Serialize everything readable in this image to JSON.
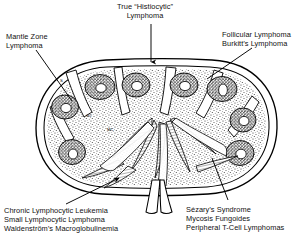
{
  "figure": {
    "kind": "lymph-node-cross-section-diagram",
    "background_color": "#ffffff",
    "ink_color": "#000000"
  },
  "labels": {
    "true_histiocytic": {
      "line1": "True “Histiocytic”",
      "line2": "Lymphoma"
    },
    "mantle_zone": {
      "line1": "Mantle Zone",
      "line2": "Lymphoma"
    },
    "follicular": {
      "line1": "Follicular Lymphoma",
      "line2": "Burkitt’s Lymphoma"
    },
    "chronic_group": {
      "line1": "Chronic Lymphocytic Leukemia",
      "line2": "Small Lymphocytic Lymphoma",
      "line3": "Waldenström’s Macroglobulinemia"
    },
    "sezary_group": {
      "line1": "Sézary’s Syndrome",
      "line2": "Mycosis Fungoides",
      "line3": "Peripheral T-Cell Lymphomas"
    }
  },
  "structure_labels": {
    "subcapsular_sinus": "S",
    "medullary_cords": "MC",
    "germinal_center": "GC"
  },
  "anatomy": {
    "capsule": "outer oval capsule of lymph node",
    "cortex": "stippled cortical region",
    "follicles_count": 9,
    "germinal_centers": "pale centers within dark follicles",
    "medulla": "radiating medullary cords and sinuses",
    "hilum": "vessels entering at bottom center"
  },
  "leaders": {
    "true_histiocytic": "vertical arrow pointing down to node apex",
    "mantle_zone": "diagonal line to left cortical follicle",
    "follicular": "diagonal line to upper right follicle",
    "chronic_group": "arrow to medullary cords lower left",
    "sezary_group": "line to paracortex lower right"
  }
}
